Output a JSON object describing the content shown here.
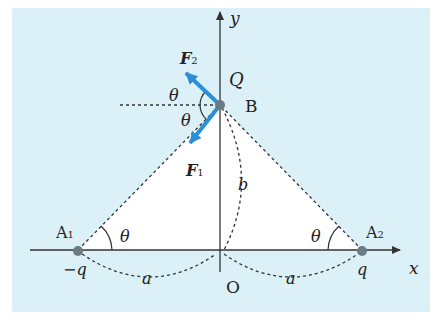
{
  "diagram": {
    "colors": {
      "panel": "#dcf0f8",
      "triangle": "#ffffff",
      "axis": "#333333",
      "dash": "#333333",
      "force": "#2a8fd6",
      "charge": "#6b7b86"
    },
    "axes": {
      "x_label": "x",
      "y_label": "y",
      "origin_label": "O"
    },
    "points": {
      "A1": {
        "label": "A",
        "sub": "1",
        "charge": "−q"
      },
      "A2": {
        "label": "A",
        "sub": "2",
        "charge": "q"
      },
      "B": {
        "label": "B",
        "charge": "Q"
      }
    },
    "forces": {
      "F1": {
        "label": "F",
        "sub": "1"
      },
      "F2": {
        "label": "F",
        "sub": "2"
      }
    },
    "angles": {
      "theta_A1": "θ",
      "theta_A2": "θ",
      "theta_B_upper": "θ",
      "theta_B_lower": "θ"
    },
    "lengths": {
      "a_left": "a",
      "a_right": "a",
      "b": "b"
    }
  }
}
